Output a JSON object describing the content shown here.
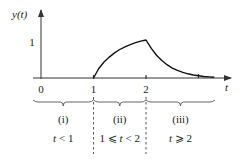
{
  "chart_data": {
    "type": "line",
    "title": "",
    "ylabel": "y(t)",
    "xlabel": "t",
    "x_ticks": [
      "0",
      "1",
      "2"
    ],
    "y_ticks": [
      "1"
    ],
    "xlim": [
      0,
      3.5
    ],
    "ylim": [
      0,
      1.6
    ],
    "series": [
      {
        "name": "y(t)",
        "x": [
          1.0,
          1.1,
          1.2,
          1.3,
          1.4,
          1.5,
          1.6,
          1.7,
          1.8,
          1.9,
          2.0,
          2.1,
          2.2,
          2.3,
          2.4,
          2.5,
          2.6,
          2.7,
          2.8,
          2.9,
          3.0,
          3.1,
          3.2,
          3.3
        ],
        "y": [
          0.0,
          0.25,
          0.42,
          0.55,
          0.66,
          0.75,
          0.82,
          0.88,
          0.93,
          0.97,
          1.0,
          0.78,
          0.6,
          0.46,
          0.35,
          0.26,
          0.2,
          0.15,
          0.11,
          0.08,
          0.06,
          0.04,
          0.03,
          0.02
        ]
      }
    ],
    "extra_tick_x": 3.0,
    "regions": [
      {
        "roman": "(i)",
        "condition": "t < 1"
      },
      {
        "roman": "(ii)",
        "condition": "1 ⩽ t < 2"
      },
      {
        "roman": "(iii)",
        "condition": "t ⩾ 2"
      }
    ],
    "dividers_at": [
      1,
      2
    ]
  }
}
